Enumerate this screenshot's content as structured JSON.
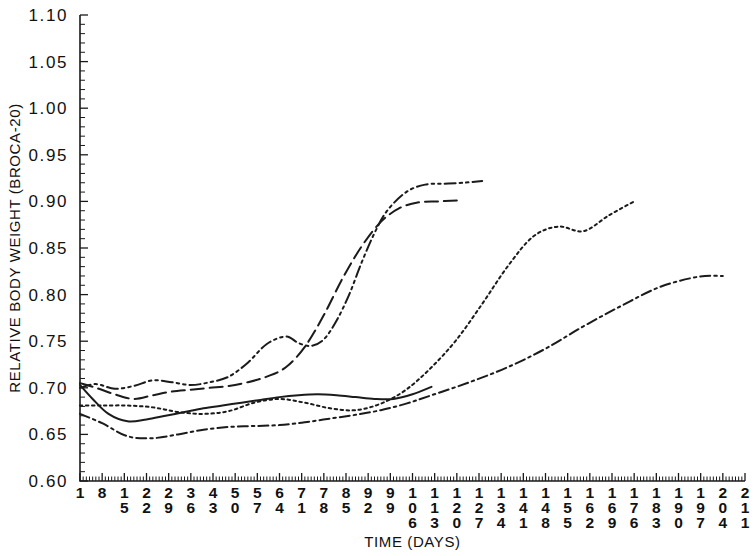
{
  "chart_data": {
    "type": "line",
    "title": "",
    "xlabel": "TIME (DAYS)",
    "ylabel": "RELATIVE BODY WEIGHT (BROCA-20)",
    "xlim": [
      1,
      211
    ],
    "ylim": [
      0.6,
      1.1
    ],
    "grid": false,
    "legend": "none",
    "ytick_labels": [
      "0.60",
      "0.65",
      "0.70",
      "0.75",
      "0.80",
      "0.85",
      "0.90",
      "0.95",
      "1.00",
      "1.05",
      "1.10"
    ],
    "ytick_values": [
      0.6,
      0.65,
      0.7,
      0.75,
      0.8,
      0.85,
      0.9,
      0.95,
      1.0,
      1.05,
      1.1
    ],
    "ytick_minor_step": 0.01,
    "xtick_labels": [
      "1",
      "8",
      "15",
      "22",
      "29",
      "36",
      "43",
      "50",
      "57",
      "64",
      "71",
      "78",
      "85",
      "92",
      "99",
      "106",
      "113",
      "120",
      "127",
      "134",
      "141",
      "148",
      "155",
      "162",
      "169",
      "176",
      "183",
      "190",
      "197",
      "204",
      "211"
    ],
    "xtick_values": [
      1,
      8,
      15,
      22,
      29,
      36,
      43,
      50,
      57,
      64,
      71,
      78,
      85,
      92,
      99,
      106,
      113,
      120,
      127,
      134,
      141,
      148,
      155,
      162,
      169,
      176,
      183,
      190,
      197,
      204,
      211
    ],
    "xtick_minor_step": 1,
    "series": [
      {
        "name": "Patient A",
        "style": "dashdotdot",
        "dasharray": "11,4,2.5,4,2.5,4",
        "x": [
          1,
          6,
          12,
          18,
          24,
          30,
          36,
          42,
          48,
          54,
          60,
          66,
          70,
          74,
          78,
          82,
          86,
          90,
          94,
          98,
          104,
          110,
          116,
          122,
          128
        ],
        "y": [
          0.7,
          0.704,
          0.699,
          0.702,
          0.708,
          0.706,
          0.703,
          0.706,
          0.712,
          0.727,
          0.747,
          0.755,
          0.748,
          0.745,
          0.752,
          0.772,
          0.8,
          0.835,
          0.866,
          0.89,
          0.91,
          0.918,
          0.919,
          0.92,
          0.922
        ]
      },
      {
        "name": "Patient B",
        "style": "dashed",
        "dasharray": "13,6",
        "x": [
          1,
          6,
          12,
          18,
          24,
          30,
          36,
          42,
          48,
          54,
          60,
          66,
          72,
          78,
          84,
          90,
          96,
          102,
          108,
          114,
          120
        ],
        "y": [
          0.705,
          0.7,
          0.693,
          0.688,
          0.692,
          0.696,
          0.698,
          0.7,
          0.702,
          0.706,
          0.712,
          0.722,
          0.744,
          0.778,
          0.818,
          0.852,
          0.878,
          0.893,
          0.899,
          0.9,
          0.901
        ]
      },
      {
        "name": "Patient C",
        "style": "dotted",
        "dasharray": "2.5,3.5",
        "x": [
          1,
          8,
          16,
          24,
          32,
          40,
          48,
          56,
          64,
          72,
          80,
          88,
          96,
          104,
          112,
          120,
          128,
          136,
          144,
          152,
          160,
          168,
          176
        ],
        "y": [
          0.681,
          0.681,
          0.681,
          0.679,
          0.674,
          0.672,
          0.675,
          0.684,
          0.688,
          0.684,
          0.678,
          0.676,
          0.683,
          0.698,
          0.722,
          0.752,
          0.79,
          0.83,
          0.862,
          0.873,
          0.868,
          0.885,
          0.9
        ]
      },
      {
        "name": "Patient D",
        "style": "dashdot",
        "dasharray": "10,4,2.5,4",
        "x": [
          1,
          8,
          16,
          24,
          32,
          40,
          48,
          56,
          64,
          72,
          80,
          88,
          96,
          104,
          112,
          124,
          136,
          148,
          160,
          172,
          184,
          196,
          204
        ],
        "y": [
          0.672,
          0.662,
          0.648,
          0.646,
          0.65,
          0.655,
          0.658,
          0.659,
          0.66,
          0.663,
          0.667,
          0.671,
          0.676,
          0.683,
          0.692,
          0.706,
          0.722,
          0.742,
          0.766,
          0.788,
          0.808,
          0.819,
          0.82
        ]
      },
      {
        "name": "Patient E",
        "style": "solid",
        "dasharray": "0",
        "x": [
          1,
          5,
          10,
          16,
          22,
          28,
          34,
          40,
          46,
          52,
          58,
          64,
          70,
          76,
          82,
          88,
          94,
          100,
          106,
          112
        ],
        "y": [
          0.703,
          0.688,
          0.672,
          0.664,
          0.666,
          0.67,
          0.674,
          0.678,
          0.681,
          0.684,
          0.687,
          0.69,
          0.692,
          0.693,
          0.692,
          0.69,
          0.688,
          0.688,
          0.693,
          0.701
        ]
      }
    ]
  },
  "geometry": {
    "plot_left": 80,
    "plot_right": 745,
    "plot_top": 15,
    "plot_bottom": 481
  }
}
